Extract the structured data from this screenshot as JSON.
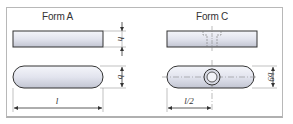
{
  "diagram": {
    "forms": [
      {
        "title": "Form A",
        "side_view": "plain rectangular key",
        "top_view": "rounded-end key",
        "dimensions": {
          "height": "h",
          "width": "b",
          "length": "l"
        }
      },
      {
        "title": "Form C",
        "side_view": "rectangular key with threaded hole",
        "top_view": "rounded-end key with central hole",
        "dimensions": {
          "width": "b9",
          "half_length": "l/2"
        }
      }
    ]
  },
  "colors": {
    "frame": "#b8b8b8",
    "fill_light": "#eceef6",
    "fill_dark": "#c9cbd6",
    "line": "#333333"
  }
}
